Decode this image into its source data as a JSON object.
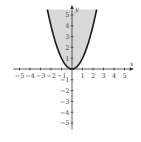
{
  "chart_data": {
    "type": "area",
    "title": "",
    "function": "y = x^2",
    "region": "y >= x^2 (shaded)",
    "xlabel": "x",
    "ylabel": "y",
    "xlim": [
      -5.5,
      5.5
    ],
    "ylim": [
      -5.5,
      5.5
    ],
    "x_ticks": [
      -5,
      -4,
      -3,
      -2,
      -1,
      1,
      2,
      3,
      4,
      5
    ],
    "y_ticks": [
      -5,
      -4,
      -3,
      -2,
      -1,
      1,
      2,
      3,
      4,
      5
    ],
    "x_tick_labels": [
      "−5",
      "−4",
      "−3",
      "−2",
      "−1",
      "1",
      "2",
      "3",
      "4",
      "5"
    ],
    "y_tick_labels": [
      "−5",
      "−4",
      "−3",
      "−2",
      "−1",
      "1",
      "2",
      "3",
      "4",
      "5"
    ],
    "grid": false,
    "fill_color": "#d9d9d9",
    "curve_color": "#1a1a1a",
    "axis_color": "#333333"
  }
}
